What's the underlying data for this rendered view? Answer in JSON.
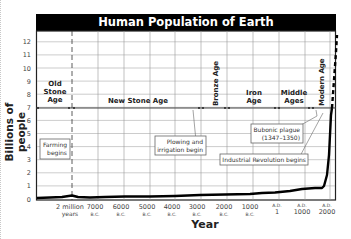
{
  "chart_data": {
    "type": "line",
    "title": "Human Population of Earth",
    "xlabel": "Year",
    "ylabel": "Billions of people",
    "ylim": [
      0,
      12
    ],
    "yticks": [
      "0",
      "1",
      "2",
      "3",
      "4",
      "5",
      "6",
      "7",
      "8",
      "9",
      "10",
      "11",
      "12"
    ],
    "grid": true,
    "x_ticks": [
      {
        "top": "",
        "bottom": "2 million",
        "sub": "years"
      },
      {
        "top": "",
        "bottom": "7000",
        "sub": "B.C."
      },
      {
        "top": "",
        "bottom": "6000",
        "sub": "B.C."
      },
      {
        "top": "",
        "bottom": "5000",
        "sub": "B.C."
      },
      {
        "top": "",
        "bottom": "4000",
        "sub": "B.C."
      },
      {
        "top": "",
        "bottom": "3000",
        "sub": "B.C."
      },
      {
        "top": "",
        "bottom": "2000",
        "sub": "B.C."
      },
      {
        "top": "",
        "bottom": "1000",
        "sub": "B.C."
      },
      {
        "top": "A.D.",
        "bottom": "1",
        "sub": ""
      },
      {
        "top": "A.D.",
        "bottom": "1000",
        "sub": ""
      },
      {
        "top": "A.D.",
        "bottom": "2000",
        "sub": ""
      }
    ],
    "series": [
      {
        "name": "World population",
        "x": [
          "2 million years",
          "7000 B.C.",
          "6000 B.C.",
          "5000 B.C.",
          "4000 B.C.",
          "3000 B.C.",
          "2000 B.C.",
          "1000 B.C.",
          "A.D. 1",
          "A.D. 1000",
          "A.D. 1350",
          "A.D. 1800",
          "A.D. 1900",
          "A.D. 1950",
          "A.D. 2000"
        ],
        "values": [
          0.3,
          0.1,
          0.1,
          0.1,
          0.1,
          0.15,
          0.2,
          0.3,
          0.4,
          0.6,
          0.5,
          1.0,
          1.6,
          2.5,
          6.5
        ]
      },
      {
        "name": "Projection",
        "style": "dashed",
        "x": [
          "A.D. 2000",
          "A.D. 2050"
        ],
        "values": [
          6.5,
          12
        ]
      }
    ],
    "eras": [
      {
        "label": "Old Stone Age",
        "orientation": "horizontal"
      },
      {
        "label": "New Stone Age",
        "orientation": "horizontal"
      },
      {
        "label": "Bronze Age",
        "orientation": "vertical"
      },
      {
        "label": "Iron Age",
        "orientation": "horizontal"
      },
      {
        "label": "Middle Ages",
        "orientation": "horizontal"
      },
      {
        "label": "Modern Age",
        "orientation": "vertical"
      }
    ],
    "annotations": [
      {
        "text": "Farming begins",
        "points_to": "7000 B.C."
      },
      {
        "text": "Plowing and irrigation begin",
        "points_to": "3500 B.C."
      },
      {
        "text": "Bubonic plague (1347–1350)",
        "points_to": "A.D. 1350"
      },
      {
        "text": "Industrial Revolution begins",
        "points_to": "A.D. 1750"
      }
    ]
  },
  "labels": {
    "title": "Human Population of Earth",
    "ylabel": "Billions of people",
    "xlabel": "Year",
    "era_old_1": "Old",
    "era_old_2": "Stone",
    "era_old_3": "Age",
    "era_new": "New Stone Age",
    "era_bronze": "Bronze Age",
    "era_iron_1": "Iron",
    "era_iron_2": "Age",
    "era_middle_1": "Middle",
    "era_middle_2": "Ages",
    "era_modern": "Modern Age",
    "ann_farming_1": "Farming",
    "ann_farming_2": "begins",
    "ann_plow_1": "Plowing and",
    "ann_plow_2": "irrigation begin",
    "ann_plague_1": "Bubonic plague",
    "ann_plague_2": "(1347–1350)",
    "ann_industrial": "Industrial Revolution begins"
  }
}
